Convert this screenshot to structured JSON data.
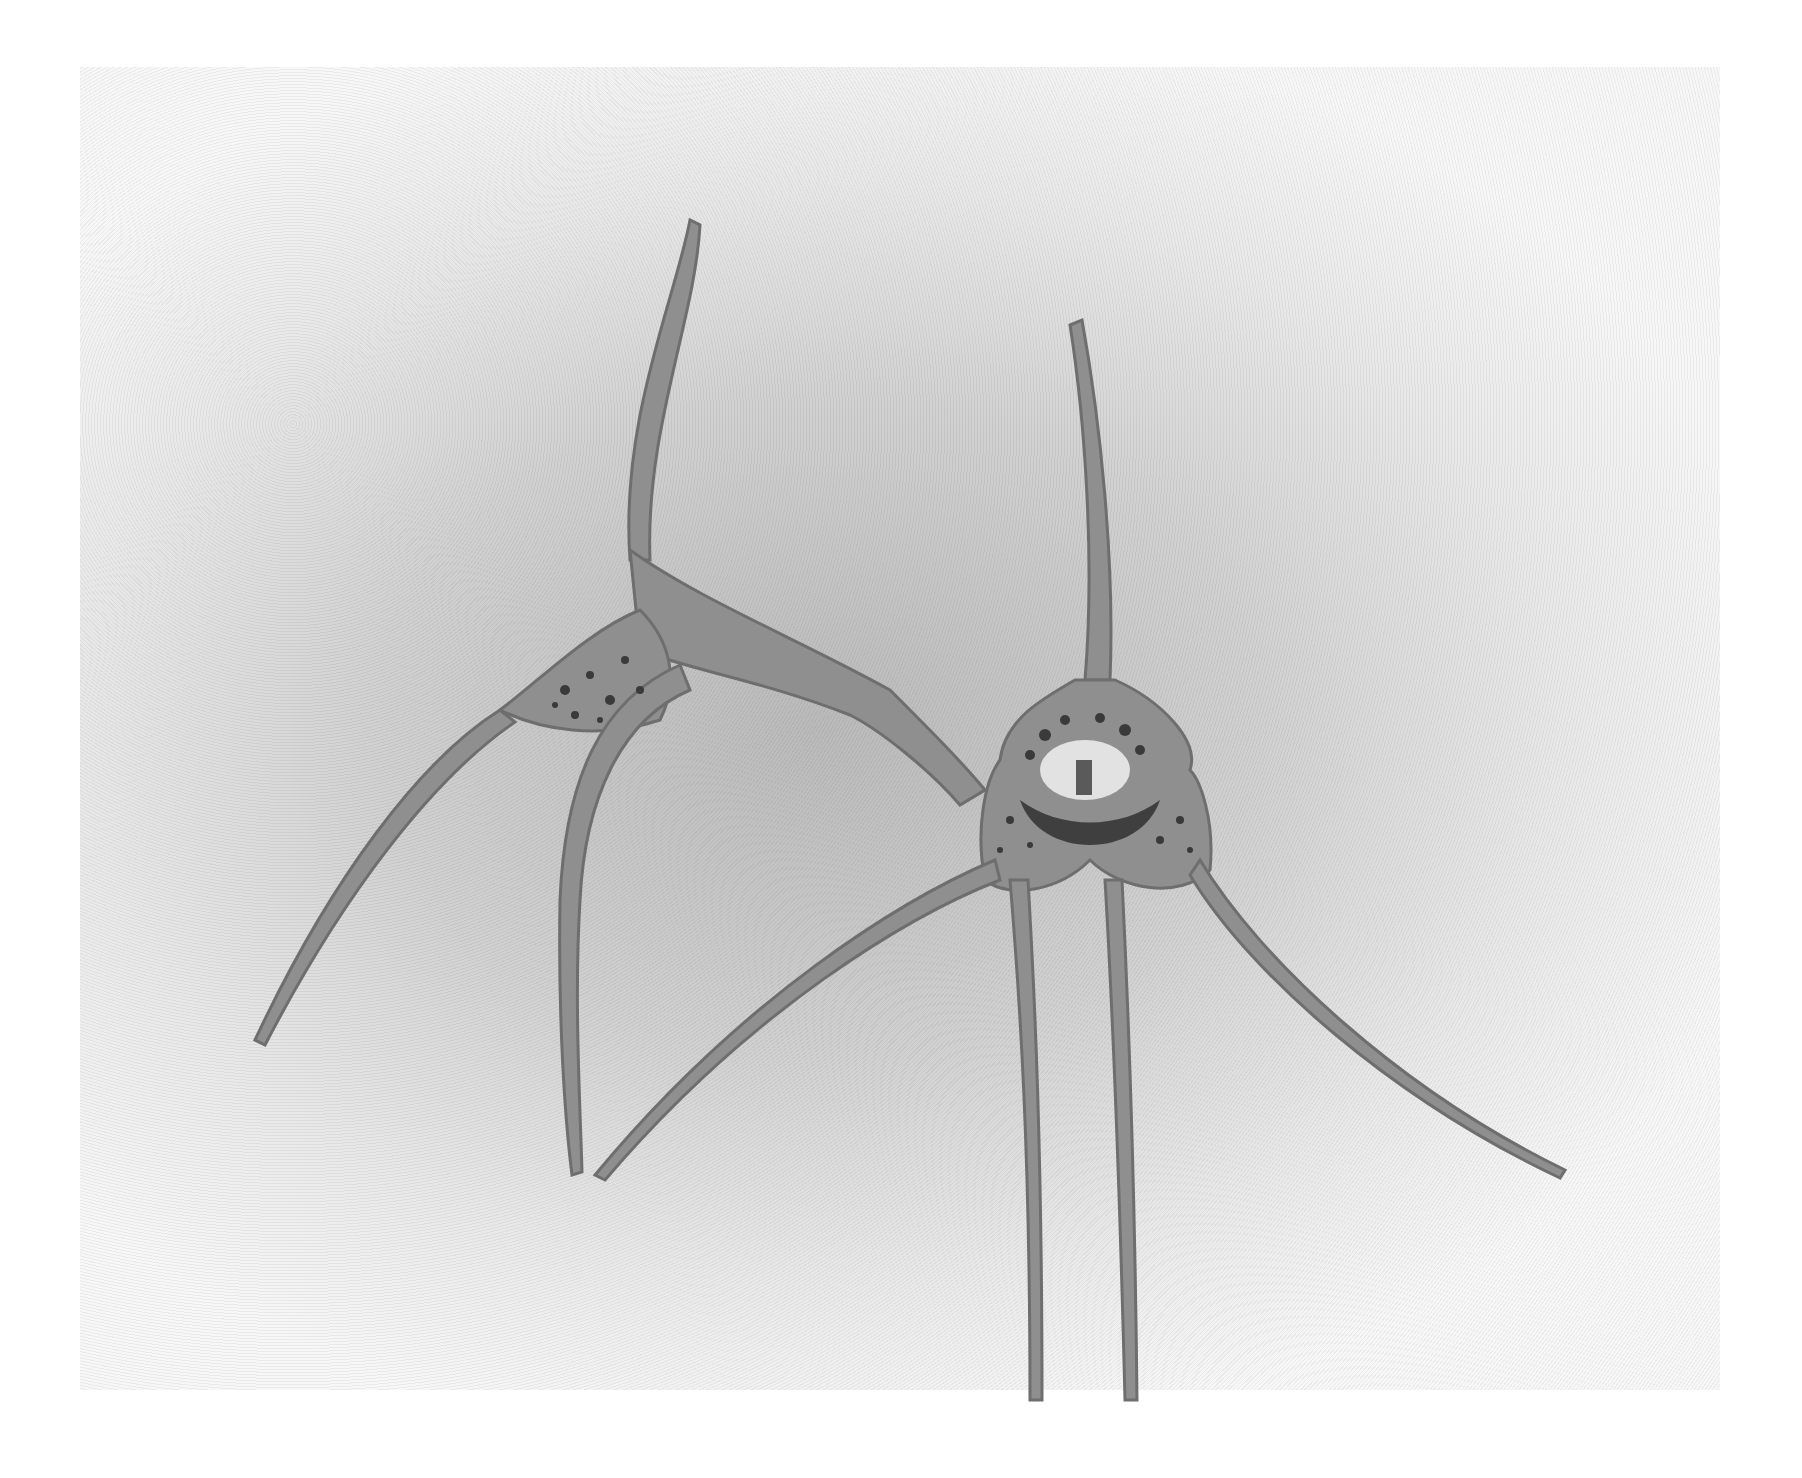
{
  "image": {
    "description": "Grayscale watercolor illustration of two spidery orchid flowers with long tail-like sepals on textured paper",
    "subjects": [
      {
        "name": "left-flower",
        "view": "side view",
        "features": [
          "long upright dorsal sepal tail",
          "spotted lateral sepals",
          "long drooping tails"
        ]
      },
      {
        "name": "right-flower",
        "view": "front view",
        "features": [
          "upright dorsal tail",
          "spotted cup with pale center and column",
          "two long pendant tails",
          "two side tails"
        ]
      }
    ],
    "colors": {
      "paper_light": "#f2f2f2",
      "paper_mid": "#c4c4c4",
      "petal": "#8f8f8f",
      "petal_edge": "#6a6a6a",
      "spots": "#3a3a3a",
      "center": "#e2e2e2"
    }
  }
}
